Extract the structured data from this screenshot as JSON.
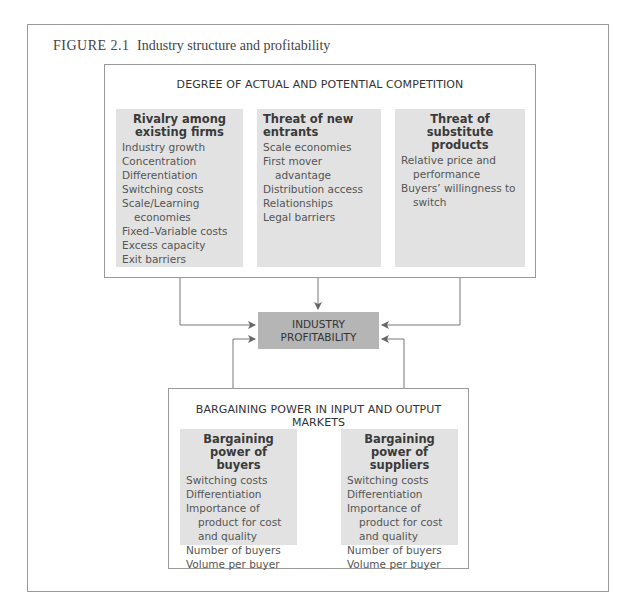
{
  "figure": {
    "label": "FIGURE 2.1",
    "title": "Industry structure and profitability"
  },
  "top_box": {
    "title": "DEGREE OF ACTUAL AND POTENTIAL COMPETITION",
    "columns": [
      {
        "heading": "Rivalry among existing firms",
        "items": [
          "Industry growth",
          "Concentration",
          "Differentiation",
          "Switching costs",
          "Scale/Learning economies",
          "Fixed–Variable costs",
          "Excess capacity",
          "Exit barriers"
        ]
      },
      {
        "heading": "Threat of new entrants",
        "items": [
          "Scale economies",
          "First mover advantage",
          "Distribution access",
          "Relationships",
          "Legal barriers"
        ]
      },
      {
        "heading": "Threat of substitute products",
        "items": [
          "Relative price and performance",
          "Buyers’ willingness to switch"
        ]
      }
    ]
  },
  "center": {
    "line1": "INDUSTRY",
    "line2": "PROFITABILITY"
  },
  "bottom_box": {
    "title": "BARGAINING POWER IN INPUT AND OUTPUT MARKETS",
    "columns": [
      {
        "heading": "Bargaining power of buyers",
        "items": [
          "Switching costs",
          "Differentiation",
          "Importance of product for cost and quality",
          "Number of buyers",
          "Volume per buyer"
        ]
      },
      {
        "heading": "Bargaining power of suppliers",
        "items": [
          "Switching costs",
          "Differentiation",
          "Importance of product for cost and quality",
          "Number of buyers",
          "Volume per buyer"
        ]
      }
    ]
  },
  "colors": {
    "column_fill": "#e2e2e2",
    "center_fill": "#b5b5b5",
    "border": "#9a9a9a",
    "arrow": "#666666"
  }
}
